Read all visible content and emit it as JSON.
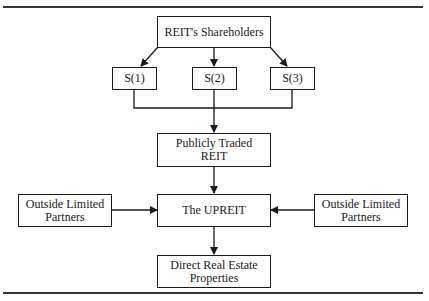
{
  "diagram": {
    "nodes": {
      "shareholders": "REIT's Shareholders",
      "s1": "S(1)",
      "s2": "S(2)",
      "s3": "S(3)",
      "public_reit_line1": "Publicly Traded",
      "public_reit_line2": "REIT",
      "upreit": "The UPREIT",
      "olp_left_line1": "Outside Limited",
      "olp_left_line2": "Partners",
      "olp_right_line1": "Outside Limited",
      "olp_right_line2": "Partners",
      "direct_line1": "Direct Real Estate",
      "direct_line2": "Properties"
    },
    "edges": [
      {
        "from": "REIT's Shareholders",
        "to": "S(1)"
      },
      {
        "from": "REIT's Shareholders",
        "to": "S(2)"
      },
      {
        "from": "REIT's Shareholders",
        "to": "S(3)"
      },
      {
        "from": "S(1)",
        "to": "Publicly Traded REIT"
      },
      {
        "from": "S(2)",
        "to": "Publicly Traded REIT"
      },
      {
        "from": "S(3)",
        "to": "Publicly Traded REIT"
      },
      {
        "from": "Publicly Traded REIT",
        "to": "The UPREIT"
      },
      {
        "from": "Outside Limited Partners (left)",
        "to": "The UPREIT"
      },
      {
        "from": "Outside Limited Partners (right)",
        "to": "The UPREIT"
      },
      {
        "from": "The UPREIT",
        "to": "Direct Real Estate Properties"
      }
    ]
  }
}
